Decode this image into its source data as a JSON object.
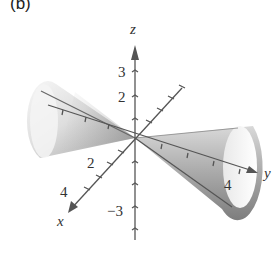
{
  "figure": {
    "panel_label": "(b)",
    "axes": {
      "x": {
        "label": "x",
        "tick_labels": [
          "2",
          "4"
        ]
      },
      "y": {
        "label": "y",
        "tick_labels": [
          "4"
        ]
      },
      "z": {
        "label": "z",
        "tick_labels": [
          "3",
          "2",
          "−3"
        ]
      }
    },
    "colors": {
      "surface_light": "#f2f2f2",
      "surface_mid": "#c8c8c8",
      "surface_dark": "#8a8a8a",
      "axis": "#555555"
    }
  }
}
